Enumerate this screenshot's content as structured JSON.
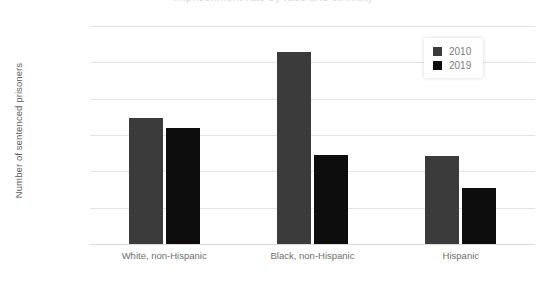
{
  "title_partial": "Imprisonment rate by race and ethnicity",
  "chart_data": {
    "type": "bar",
    "title": "",
    "xlabel": "",
    "ylabel": "Number of sentenced prisoners",
    "categories": [
      "White, non-Hispanic",
      "Black, non-Hispanic",
      "Hispanic"
    ],
    "series": [
      {
        "name": "2010",
        "color": "#3b3b3b",
        "values": [
          69500,
          105500,
          48500
        ]
      },
      {
        "name": "2019",
        "color": "#0d0d0d",
        "values": [
          64000,
          49000,
          31000
        ]
      }
    ],
    "ylim": [
      0,
      120000
    ],
    "yticks": [
      0,
      20000,
      40000,
      60000,
      80000,
      100000,
      120000
    ],
    "ytick_labels": [
      "0",
      "20,000",
      "40,000",
      "60,000",
      "80,000",
      "100,000",
      "120,000"
    ],
    "grid": true,
    "legend_position": "top-right"
  }
}
